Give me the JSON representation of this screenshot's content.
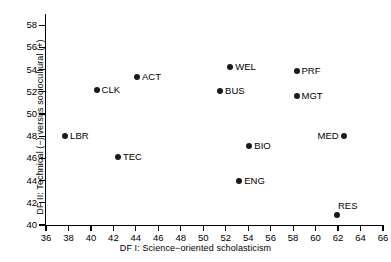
{
  "chart_data": {
    "type": "scatter",
    "title": "",
    "xlabel": "DF I: Science−oriented scholasticism",
    "ylabel": "DF II: Technical (−) versus sociocultural (+)",
    "xlim": [
      36,
      66
    ],
    "ylim": [
      40,
      59
    ],
    "xticks": [
      36,
      38,
      40,
      42,
      44,
      46,
      48,
      50,
      52,
      54,
      56,
      58,
      60,
      62,
      64,
      66
    ],
    "yticks": [
      40,
      42,
      44,
      46,
      48,
      50,
      52,
      54,
      56,
      58
    ],
    "grid": false,
    "legend": null,
    "points": [
      {
        "label": "LBR",
        "x": 37.7,
        "y": 48.0,
        "label_pos": "right"
      },
      {
        "label": "CLK",
        "x": 40.5,
        "y": 52.2,
        "label_pos": "right"
      },
      {
        "label": "TEC",
        "x": 42.4,
        "y": 46.1,
        "label_pos": "right"
      },
      {
        "label": "ACT",
        "x": 44.1,
        "y": 53.3,
        "label_pos": "right"
      },
      {
        "label": "BUS",
        "x": 51.5,
        "y": 52.1,
        "label_pos": "right"
      },
      {
        "label": "WEL",
        "x": 52.4,
        "y": 54.2,
        "label_pos": "right"
      },
      {
        "label": "ENG",
        "x": 53.2,
        "y": 44.0,
        "label_pos": "right"
      },
      {
        "label": "BIO",
        "x": 54.1,
        "y": 47.1,
        "label_pos": "right"
      },
      {
        "label": "MGT",
        "x": 58.3,
        "y": 51.6,
        "label_pos": "right"
      },
      {
        "label": "PRF",
        "x": 58.3,
        "y": 53.9,
        "label_pos": "right"
      },
      {
        "label": "RES",
        "x": 61.9,
        "y": 40.9,
        "label_pos": "above"
      },
      {
        "label": "MED",
        "x": 62.5,
        "y": 48.0,
        "label_pos": "left"
      }
    ]
  }
}
